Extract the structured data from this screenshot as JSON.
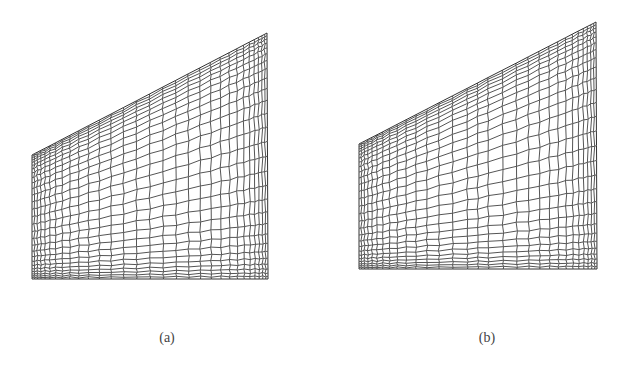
{
  "figure": {
    "panels": [
      {
        "id": "a",
        "caption": "(a)",
        "caption_pos": [
          167,
          340
        ],
        "corners": {
          "top_left": [
            32,
            155
          ],
          "top_right": [
            267,
            33
          ],
          "bottom_right": [
            268,
            279
          ],
          "bottom_left": [
            32,
            279
          ]
        },
        "columns": 30,
        "rows": 28,
        "boundary_clustering": 0.35,
        "interior_cluster": null
      },
      {
        "id": "b",
        "caption": "(b)",
        "caption_pos": [
          487,
          340
        ],
        "corners": {
          "top_left": [
            359,
            144
          ],
          "top_right": [
            596,
            22
          ],
          "bottom_right": [
            597,
            269
          ],
          "bottom_left": [
            359,
            269
          ]
        },
        "columns": 30,
        "rows": 28,
        "boundary_clustering": 0.35,
        "interior_cluster": {
          "position": 0.5,
          "strength": 0.12,
          "width": 0.08
        }
      }
    ],
    "line_color": "#555555",
    "outline_color": "#333333"
  }
}
